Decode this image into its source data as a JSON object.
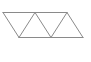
{
  "diagram": {
    "title": "",
    "stroke_color": "#8a8a8a",
    "background": "#ffffff",
    "stroke_width": 1,
    "top_edge": {
      "x1": 3,
      "y1": 12.5,
      "x2": 67,
      "y2": 12.5
    },
    "bottom_edge": {
      "x1": 19,
      "y1": 37.5,
      "x2": 83,
      "y2": 37.5
    },
    "diagonals": [
      {
        "x1": 3,
        "y1": 12.5,
        "x2": 19,
        "y2": 37.5
      },
      {
        "x1": 19,
        "y1": 37.5,
        "x2": 35,
        "y2": 12.5
      },
      {
        "x1": 35,
        "y1": 12.5,
        "x2": 51,
        "y2": 37.5
      },
      {
        "x1": 51,
        "y1": 37.5,
        "x2": 67,
        "y2": 12.5
      },
      {
        "x1": 67,
        "y1": 12.5,
        "x2": 83,
        "y2": 37.5
      }
    ]
  }
}
